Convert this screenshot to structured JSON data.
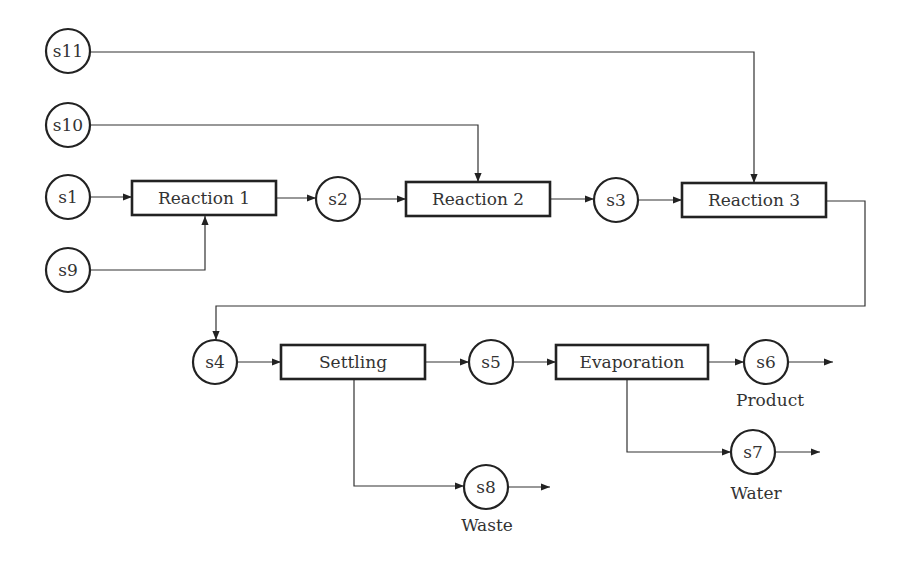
{
  "diagram": {
    "type": "process-flow",
    "streams": {
      "s1": "s1",
      "s2": "s2",
      "s3": "s3",
      "s4": "s4",
      "s5": "s5",
      "s6": "s6",
      "s7": "s7",
      "s8": "s8",
      "s9": "s9",
      "s10": "s10",
      "s11": "s11"
    },
    "units": {
      "reaction1": "Reaction 1",
      "reaction2": "Reaction 2",
      "reaction3": "Reaction 3",
      "settling": "Settling",
      "evaporation": "Evaporation"
    },
    "captions": {
      "s6": "Product",
      "s7": "Water",
      "s8": "Waste"
    },
    "edges": [
      [
        "s1",
        "Reaction 1"
      ],
      [
        "s9",
        "Reaction 1"
      ],
      [
        "Reaction 1",
        "s2"
      ],
      [
        "s2",
        "Reaction 2"
      ],
      [
        "s10",
        "Reaction 2"
      ],
      [
        "Reaction 2",
        "s3"
      ],
      [
        "s3",
        "Reaction 3"
      ],
      [
        "s11",
        "Reaction 3"
      ],
      [
        "Reaction 3",
        "s4"
      ],
      [
        "s4",
        "Settling"
      ],
      [
        "Settling",
        "s5"
      ],
      [
        "Settling",
        "s8"
      ],
      [
        "s5",
        "Evaporation"
      ],
      [
        "Evaporation",
        "s6"
      ],
      [
        "Evaporation",
        "s7"
      ],
      [
        "s6",
        "out"
      ],
      [
        "s7",
        "out"
      ],
      [
        "s8",
        "out"
      ]
    ]
  }
}
